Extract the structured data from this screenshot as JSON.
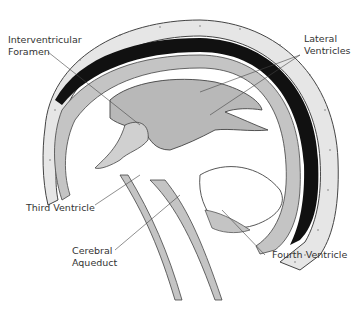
{
  "diagram": {
    "labels": [
      {
        "id": "interventricular-foramen",
        "line1": "Interventricular",
        "line2": "Foramen"
      },
      {
        "id": "lateral-ventricles",
        "line1": "Lateral",
        "line2": "Ventricles"
      },
      {
        "id": "third-ventricle",
        "line1": "Third Ventricle",
        "line2": ""
      },
      {
        "id": "cerebral-aqueduct",
        "line1": "Cerebral",
        "line2": "Aqueduct"
      },
      {
        "id": "fourth-ventricle",
        "line1": "Fourth Ventricle",
        "line2": ""
      }
    ],
    "colors": {
      "skull": "#e6e6e6",
      "ventricle": "#b8b8b8",
      "sinus": "#111111",
      "outline": "#444444"
    }
  }
}
